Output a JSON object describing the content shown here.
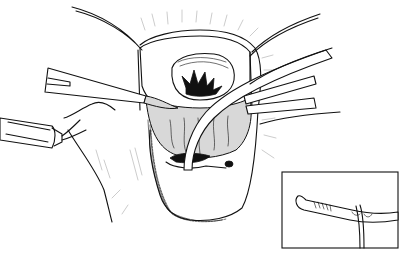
{
  "figure": {
    "kind": "surgical line illustration",
    "background": "#ffffff",
    "ink": "#111111",
    "elements": [
      "open-wound-field",
      "sutures",
      "retractor-left",
      "retractor-right",
      "catheter-tube",
      "clamp-left",
      "inset-catheter-detail"
    ]
  }
}
